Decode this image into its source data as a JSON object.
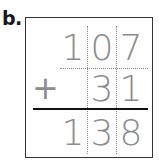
{
  "problem": {
    "label": "b.",
    "addend1": [
      "1",
      "0",
      "7"
    ],
    "operator": "+",
    "addend2": [
      "",
      "3",
      "1"
    ],
    "sum": [
      "1",
      "3",
      "8"
    ]
  }
}
